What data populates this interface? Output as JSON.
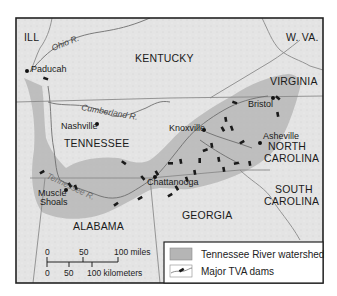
{
  "map": {
    "title": "Tennessee Valley Authority region",
    "states": [
      {
        "name": "ILL",
        "x": 24,
        "y": 41
      },
      {
        "name": "KENTUCKY",
        "x": 135,
        "y": 62
      },
      {
        "name": "W. VA.",
        "x": 286,
        "y": 41
      },
      {
        "name": "VIRGINIA",
        "x": 270,
        "y": 85
      },
      {
        "name": "TENNESSEE",
        "x": 64,
        "y": 147
      },
      {
        "name": "NORTH",
        "x": 268,
        "y": 150
      },
      {
        "name": "CAROLINA",
        "x": 264,
        "y": 162
      },
      {
        "name": "SOUTH",
        "x": 275,
        "y": 193
      },
      {
        "name": "CAROLINA",
        "x": 264,
        "y": 205
      },
      {
        "name": "GEORGIA",
        "x": 182,
        "y": 219
      },
      {
        "name": "ALABAMA",
        "x": 73,
        "y": 230
      }
    ],
    "rivers": [
      {
        "name": "Ohio R.",
        "x": 53,
        "y": 51,
        "rotate": -22
      },
      {
        "name": "Cumberland R.",
        "x": 81,
        "y": 110,
        "rotate": 10
      },
      {
        "name": "Tennessee R.",
        "x": 46,
        "y": 178,
        "rotate": 25
      }
    ],
    "cities": [
      {
        "name": "Paducah",
        "dot_x": 27,
        "dot_y": 71,
        "label_x": 31,
        "label_y": 72
      },
      {
        "name": "Nashville",
        "dot_x": 97,
        "dot_y": 124,
        "label_x": 61,
        "label_y": 129
      },
      {
        "name": "Knoxville",
        "dot_x": 204,
        "dot_y": 130,
        "label_x": 169,
        "label_y": 131
      },
      {
        "name": "Bristol",
        "dot_x": 273,
        "dot_y": 98,
        "label_x": 248,
        "label_y": 107
      },
      {
        "name": "Asheville",
        "dot_x": 260,
        "dot_y": 143,
        "label_x": 263,
        "label_y": 139
      },
      {
        "name": "Chattanooga",
        "dot_x": 155,
        "dot_y": 177,
        "label_x": 147,
        "label_y": 185
      },
      {
        "name": "Muscle",
        "dot_x": 66,
        "dot_y": 190,
        "label_x": 38,
        "label_y": 196
      },
      {
        "name": "Shoals",
        "dot_x": null,
        "dot_y": null,
        "label_x": 40,
        "label_y": 205
      }
    ],
    "dams": [
      [
        45,
        79
      ],
      [
        123,
        163
      ],
      [
        42,
        173
      ],
      [
        69,
        185
      ],
      [
        75,
        187
      ],
      [
        116,
        205
      ],
      [
        142,
        178
      ],
      [
        156,
        173
      ],
      [
        170,
        164
      ],
      [
        180,
        161
      ],
      [
        186,
        179
      ],
      [
        194,
        172
      ],
      [
        199,
        160
      ],
      [
        205,
        151
      ],
      [
        211,
        145
      ],
      [
        222,
        129
      ],
      [
        225,
        119
      ],
      [
        231,
        128
      ],
      [
        234,
        103
      ],
      [
        242,
        143
      ],
      [
        249,
        163
      ],
      [
        223,
        169
      ],
      [
        236,
        164
      ],
      [
        170,
        196
      ],
      [
        176,
        188
      ],
      [
        277,
        98
      ],
      [
        277,
        114
      ],
      [
        140,
        199
      ],
      [
        200,
        160
      ],
      [
        218,
        159
      ]
    ]
  },
  "scale_bar": {
    "miles_labels": [
      "0",
      "50",
      "100 miles"
    ],
    "km_labels": [
      "0",
      "50",
      "100 kilometers"
    ]
  },
  "legend": {
    "items": [
      {
        "label": "Tennessee River watershed",
        "swatch": "watershed"
      },
      {
        "label": "Major TVA dams",
        "swatch": "dam"
      }
    ]
  },
  "colors": {
    "land": "#e6e6e6",
    "watershed": "#b5b5b5",
    "border": "#8a8a8a",
    "river": "#6e6e6e",
    "frame": "#222222",
    "dam": "#1a1a1a"
  }
}
